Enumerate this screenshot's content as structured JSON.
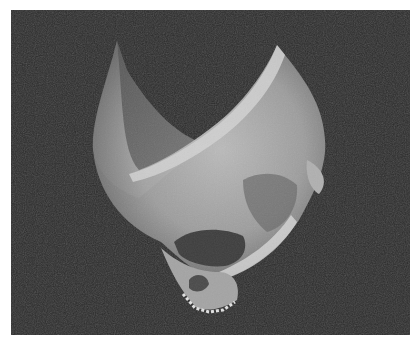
{
  "image": {
    "kind": "3D volume rendering",
    "subject": "human skull, cut-away cranial vault, oblique view from below-left",
    "background_color": "#2b2b2b",
    "frame_color": "#ffffff",
    "bone_color": "#b9b9b9"
  }
}
